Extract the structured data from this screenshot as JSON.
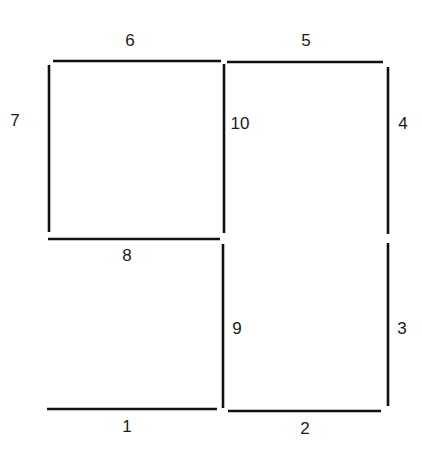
{
  "diagram": {
    "type": "segment-grid",
    "segments": [
      {
        "id": "1",
        "orientation": "horizontal",
        "x1": 47,
        "y1": 409,
        "x2": 217,
        "y2": 409,
        "label": {
          "text": "1",
          "x": 127,
          "y": 428
        }
      },
      {
        "id": "2",
        "orientation": "horizontal",
        "x1": 228,
        "y1": 411,
        "x2": 381,
        "y2": 411,
        "label": {
          "text": "2",
          "x": 305,
          "y": 430
        }
      },
      {
        "id": "3",
        "orientation": "vertical",
        "x1": 388,
        "y1": 243,
        "x2": 388,
        "y2": 406,
        "label": {
          "text": "3",
          "x": 402,
          "y": 330
        }
      },
      {
        "id": "4",
        "orientation": "vertical",
        "x1": 388,
        "y1": 67,
        "x2": 388,
        "y2": 234,
        "label": {
          "text": "4",
          "x": 403,
          "y": 125
        }
      },
      {
        "id": "5",
        "orientation": "horizontal",
        "x1": 227,
        "y1": 62,
        "x2": 383,
        "y2": 62,
        "label": {
          "text": "5",
          "x": 306,
          "y": 42
        }
      },
      {
        "id": "6",
        "orientation": "horizontal",
        "x1": 53,
        "y1": 61,
        "x2": 221,
        "y2": 61,
        "label": {
          "text": "6",
          "x": 130,
          "y": 42
        }
      },
      {
        "id": "7",
        "orientation": "vertical",
        "x1": 49,
        "y1": 65,
        "x2": 49,
        "y2": 232,
        "label": {
          "text": "7",
          "x": 15,
          "y": 122
        }
      },
      {
        "id": "8",
        "orientation": "horizontal",
        "x1": 48,
        "y1": 239,
        "x2": 220,
        "y2": 239,
        "label": {
          "text": "8",
          "x": 127,
          "y": 257
        }
      },
      {
        "id": "9",
        "orientation": "vertical",
        "x1": 223,
        "y1": 244,
        "x2": 223,
        "y2": 408,
        "label": {
          "text": "9",
          "x": 237,
          "y": 330
        }
      },
      {
        "id": "10",
        "orientation": "vertical",
        "x1": 224,
        "y1": 64,
        "x2": 224,
        "y2": 233,
        "label": {
          "text": "10",
          "x": 240,
          "y": 125
        }
      }
    ],
    "colors": {
      "line": "#111111",
      "label": "#1a1a1a",
      "background": "#ffffff"
    }
  }
}
